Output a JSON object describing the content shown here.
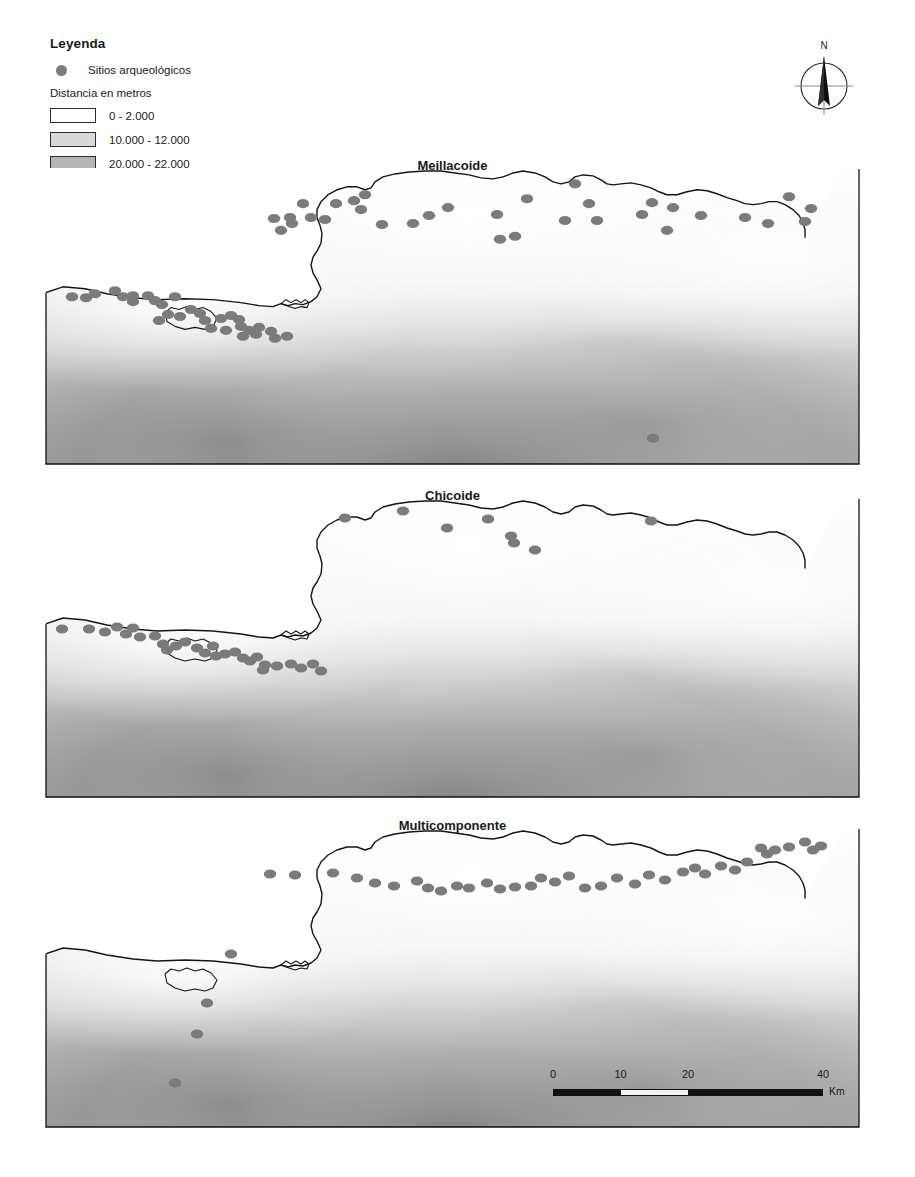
{
  "legend": {
    "title": "Leyenda",
    "site_symbol_label": "Sitios arqueológicos",
    "site_symbol_color": "#7b7b7b",
    "ramp_title": "Distancia en metros",
    "ramp_classes": [
      {
        "label": "0 - 2.000",
        "color": "#ffffff"
      },
      {
        "label": "10.000 - 12.000",
        "color": "#d9d9d9"
      },
      {
        "label": "20.000 - 22.000",
        "color": "#b5b5b5"
      },
      {
        "label": "30.000 - 32.000",
        "color": "#8f8f8f"
      },
      {
        "label": "38.000 - 40.000",
        "color": "#595959"
      }
    ]
  },
  "north_arrow": {
    "label": "N"
  },
  "scale_bar": {
    "unit": "Km",
    "ticks": [
      "0",
      "10",
      "20",
      "40"
    ],
    "tick_positions_pct": [
      0,
      25,
      50,
      100
    ]
  },
  "panels": [
    {
      "title": "Meillacoide"
    },
    {
      "title": "Chicoide"
    },
    {
      "title": "Multicomponente"
    }
  ],
  "map_data": {
    "type": "choropleth-point-map",
    "description": "Three stacked panels of the same coastal study area with a grayscale distance-raster background and archaeological site point locations.",
    "viewbox": [
      0,
      0,
      815,
      300
    ],
    "coastline_path": "M 0,126 L 18,120 L 40,122 L 62,127 L 88,131 L 112,133 L 140,132 L 168,133 L 196,136 L 214,139 L 228,140 L 236,137 L 243,139 L 250,137 L 258,138 L 266,135 L 272,130 L 276,122 L 272,113 L 268,106 L 266,98 L 268,90 L 272,84 L 276,76 L 277,66 L 275,58 L 272,50 L 272,42 L 276,34 L 283,27 L 292,22 L 302,19 L 312,19 L 320,22 L 326,20 L 330,14 L 338,9 L 350,6 L 364,4 L 380,3 L 396,3 L 410,5 L 424,7 L 436,10 L 448,11 L 458,9 L 468,5 L 478,3 L 490,5 L 500,9 L 508,14 L 516,16 L 524,14 L 530,9 L 538,7 L 548,8 L 556,12 L 562,16 L 568,17 L 576,16 L 586,15 L 596,17 L 606,20 L 614,24 L 622,27 L 632,27 L 642,24 L 652,22 L 662,23 L 672,26 L 682,30 L 692,33 L 700,36 L 708,37 L 716,36 L 724,34 L 732,34 L 740,37 L 748,42 L 754,48 L 758,55 L 760,62 L 760,70",
    "coastline_west_path": "M 0,126 L -5,126",
    "site_counts": {
      "panel_1": 62,
      "panel_2": 36,
      "panel_3": 41
    },
    "sites_panel_1": [
      [
        320,
        27
      ],
      [
        258,
        36
      ],
      [
        291,
        36
      ],
      [
        309,
        33
      ],
      [
        316,
        42
      ],
      [
        403,
        40
      ],
      [
        452,
        47
      ],
      [
        530,
        16
      ],
      [
        700,
        50
      ],
      [
        337,
        57
      ],
      [
        368,
        56
      ],
      [
        384,
        48
      ],
      [
        482,
        31
      ],
      [
        229,
        51
      ],
      [
        247,
        56
      ],
      [
        266,
        50
      ],
      [
        280,
        52
      ],
      [
        236,
        63
      ],
      [
        245,
        50
      ],
      [
        470,
        69
      ],
      [
        455,
        72
      ],
      [
        520,
        53
      ],
      [
        544,
        36
      ],
      [
        552,
        53
      ],
      [
        597,
        47
      ],
      [
        607,
        35
      ],
      [
        622,
        63
      ],
      [
        628,
        40
      ],
      [
        656,
        48
      ],
      [
        723,
        56
      ],
      [
        744,
        29
      ],
      [
        760,
        54
      ],
      [
        766,
        41
      ],
      [
        27,
        130
      ],
      [
        41,
        131
      ],
      [
        50,
        127
      ],
      [
        88,
        129
      ],
      [
        103,
        129
      ],
      [
        110,
        134
      ],
      [
        70,
        124
      ],
      [
        78,
        130
      ],
      [
        88,
        135
      ],
      [
        117,
        138
      ],
      [
        130,
        130
      ],
      [
        123,
        148
      ],
      [
        114,
        154
      ],
      [
        135,
        150
      ],
      [
        146,
        143
      ],
      [
        155,
        147
      ],
      [
        160,
        154
      ],
      [
        176,
        152
      ],
      [
        186,
        149
      ],
      [
        194,
        153
      ],
      [
        166,
        162
      ],
      [
        181,
        164
      ],
      [
        196,
        160
      ],
      [
        204,
        164
      ],
      [
        214,
        161
      ],
      [
        198,
        170
      ],
      [
        211,
        168
      ],
      [
        226,
        165
      ],
      [
        230,
        172
      ],
      [
        242,
        170
      ],
      [
        608,
        273
      ]
    ],
    "sites_panel_2": [
      [
        17,
        131
      ],
      [
        44,
        131
      ],
      [
        60,
        134
      ],
      [
        72,
        129
      ],
      [
        81,
        136
      ],
      [
        88,
        130
      ],
      [
        95,
        139
      ],
      [
        110,
        138
      ],
      [
        118,
        146
      ],
      [
        122,
        152
      ],
      [
        131,
        148
      ],
      [
        140,
        144
      ],
      [
        152,
        150
      ],
      [
        160,
        155
      ],
      [
        168,
        148
      ],
      [
        171,
        158
      ],
      [
        180,
        156
      ],
      [
        190,
        154
      ],
      [
        198,
        160
      ],
      [
        205,
        163
      ],
      [
        212,
        159
      ],
      [
        220,
        167
      ],
      [
        218,
        172
      ],
      [
        232,
        168
      ],
      [
        246,
        166
      ],
      [
        256,
        170
      ],
      [
        268,
        166
      ],
      [
        276,
        173
      ],
      [
        300,
        20
      ],
      [
        358,
        13
      ],
      [
        402,
        30
      ],
      [
        443,
        21
      ],
      [
        466,
        38
      ],
      [
        469,
        45
      ],
      [
        490,
        52
      ],
      [
        606,
        23
      ]
    ],
    "sites_panel_3": [
      [
        225,
        46
      ],
      [
        250,
        47
      ],
      [
        288,
        45
      ],
      [
        312,
        50
      ],
      [
        330,
        55
      ],
      [
        349,
        58
      ],
      [
        372,
        53
      ],
      [
        383,
        60
      ],
      [
        396,
        63
      ],
      [
        412,
        58
      ],
      [
        424,
        60
      ],
      [
        442,
        55
      ],
      [
        455,
        61
      ],
      [
        470,
        59
      ],
      [
        486,
        58
      ],
      [
        496,
        50
      ],
      [
        510,
        54
      ],
      [
        524,
        48
      ],
      [
        540,
        60
      ],
      [
        556,
        58
      ],
      [
        572,
        50
      ],
      [
        590,
        56
      ],
      [
        604,
        47
      ],
      [
        620,
        52
      ],
      [
        638,
        44
      ],
      [
        650,
        40
      ],
      [
        660,
        46
      ],
      [
        676,
        38
      ],
      [
        690,
        42
      ],
      [
        702,
        34
      ],
      [
        716,
        20
      ],
      [
        722,
        26
      ],
      [
        730,
        22
      ],
      [
        744,
        19
      ],
      [
        760,
        14
      ],
      [
        768,
        22
      ],
      [
        776,
        18
      ],
      [
        186,
        126
      ],
      [
        162,
        175
      ],
      [
        152,
        206
      ],
      [
        130,
        255
      ]
    ]
  }
}
